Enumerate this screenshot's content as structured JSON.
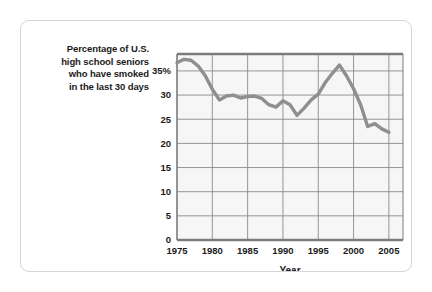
{
  "figure": {
    "caption_lines": [
      "Percentage of U.S.",
      "high school seniors",
      "who have smoked",
      "in the last 30 days"
    ]
  },
  "chart_data": {
    "type": "line",
    "title": "",
    "xlabel": "Year",
    "ylabel": "",
    "xlim": [
      1975,
      2007
    ],
    "ylim": [
      0,
      38.5
    ],
    "xticks": [
      1975,
      1980,
      1985,
      1990,
      1995,
      2000,
      2005
    ],
    "xtick_labels": [
      "1975",
      "1980",
      "1985",
      "1990",
      "1995",
      "2000",
      "2005"
    ],
    "yticks": [
      0,
      5,
      10,
      15,
      20,
      25,
      30,
      35
    ],
    "ytick_labels": [
      "0",
      "5",
      "10",
      "15",
      "20",
      "25",
      "30",
      "35%"
    ],
    "grid": true,
    "legend": "none",
    "x": [
      1975,
      1976,
      1977,
      1978,
      1979,
      1980,
      1981,
      1982,
      1983,
      1984,
      1985,
      1986,
      1987,
      1988,
      1989,
      1990,
      1991,
      1992,
      1993,
      1994,
      1995,
      1996,
      1997,
      1998,
      1999,
      2000,
      2001,
      2002,
      2003,
      2004,
      2005
    ],
    "values": [
      36.7,
      37.4,
      37.2,
      36.0,
      34.0,
      31.2,
      29.0,
      29.8,
      30.0,
      29.4,
      29.7,
      29.8,
      29.3,
      28.0,
      27.5,
      28.8,
      28.0,
      25.8,
      27.3,
      29.0,
      30.2,
      32.6,
      34.5,
      36.2,
      34.0,
      31.3,
      28.0,
      23.5,
      24.1,
      23.0,
      22.3
    ],
    "line_color": "#8f8f8f",
    "line_width": 3.4,
    "plot_bg": "#f6f6f6",
    "grid_color": "#8a8a8a",
    "frame_color": "#7c7c7c"
  }
}
